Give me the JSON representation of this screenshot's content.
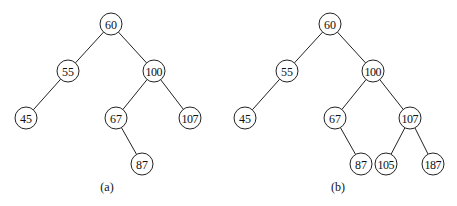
{
  "diagram": {
    "type": "binary-search-tree-comparison",
    "node_radius": 11,
    "trees": [
      {
        "id": "a",
        "caption": "(a)",
        "caption_pos": [
          107,
          191
        ],
        "nodes": [
          {
            "id": "a60",
            "label": "60",
            "x": 111,
            "y": 24
          },
          {
            "id": "a55",
            "label": "55",
            "x": 68,
            "y": 71
          },
          {
            "id": "a100",
            "label": "100",
            "x": 154,
            "y": 71
          },
          {
            "id": "a45",
            "label": "45",
            "x": 26,
            "y": 118
          },
          {
            "id": "a67",
            "label": "67",
            "x": 116,
            "y": 118
          },
          {
            "id": "a107",
            "label": "107",
            "x": 190,
            "y": 118
          },
          {
            "id": "a87",
            "label": "87",
            "x": 142,
            "y": 164
          }
        ],
        "edges": [
          [
            "a60",
            "a55"
          ],
          [
            "a60",
            "a100"
          ],
          [
            "a55",
            "a45"
          ],
          [
            "a100",
            "a67"
          ],
          [
            "a100",
            "a107"
          ],
          [
            "a67",
            "a87"
          ]
        ]
      },
      {
        "id": "b",
        "caption": "(b)",
        "caption_pos": [
          338,
          191
        ],
        "nodes": [
          {
            "id": "b60",
            "label": "60",
            "x": 330,
            "y": 24
          },
          {
            "id": "b55",
            "label": "55",
            "x": 287,
            "y": 71
          },
          {
            "id": "b100",
            "label": "100",
            "x": 373,
            "y": 71
          },
          {
            "id": "b45",
            "label": "45",
            "x": 245,
            "y": 118
          },
          {
            "id": "b67",
            "label": "67",
            "x": 335,
            "y": 118
          },
          {
            "id": "b107",
            "label": "107",
            "x": 410,
            "y": 118
          },
          {
            "id": "b87",
            "label": "87",
            "x": 361,
            "y": 164
          },
          {
            "id": "b105",
            "label": "105",
            "x": 386,
            "y": 164
          },
          {
            "id": "b187",
            "label": "187",
            "x": 433,
            "y": 164
          }
        ],
        "edges": [
          [
            "b60",
            "b55"
          ],
          [
            "b60",
            "b100"
          ],
          [
            "b55",
            "b45"
          ],
          [
            "b100",
            "b67"
          ],
          [
            "b100",
            "b107"
          ],
          [
            "b67",
            "b87"
          ],
          [
            "b107",
            "b105"
          ],
          [
            "b107",
            "b187"
          ]
        ]
      }
    ]
  }
}
